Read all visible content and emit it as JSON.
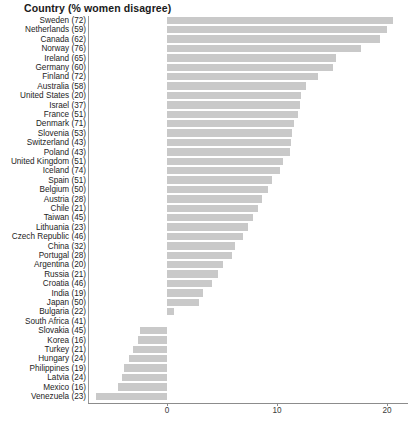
{
  "chart_data": {
    "type": "bar",
    "orientation": "horizontal",
    "title": "Country (% women disagree)",
    "xlabel": "",
    "ylabel": "",
    "xlim": [
      -7.0,
      21.5
    ],
    "grid": false,
    "legend": null,
    "axis_ticks": [
      {
        "label": "0",
        "value": 0
      },
      {
        "label": "10",
        "value": 10
      },
      {
        "label": "20",
        "value": 20
      }
    ],
    "bar_color": "#c9c9c9",
    "categories": [
      "Sweden (72)",
      "Netherlands (59)",
      "Canada (62)",
      "Norway (76)",
      "Ireland (65)",
      "Germany (60)",
      "Finland (72)",
      "Australia (58)",
      "United States (20)",
      "Israel (37)",
      "France (51)",
      "Denmark (71)",
      "Slovenia (53)",
      "Switzerland (43)",
      "Poland (43)",
      "United Kingdom (51)",
      "Iceland (74)",
      "Spain (51)",
      "Belgium (50)",
      "Austria (28)",
      "Chile (21)",
      "Taiwan (45)",
      "Lithuania (23)",
      "Czech Republic (46)",
      "China (32)",
      "Portugal (28)",
      "Argentina (20)",
      "Russia (21)",
      "Croatia (46)",
      "India (19)",
      "Japan (50)",
      "Bulgaria (22)",
      "South Africa (41)",
      "Slovakia (45)",
      "Korea (16)",
      "Turkey (21)",
      "Hungary (24)",
      "Philippines (19)",
      "Latvia (24)",
      "Mexico (16)",
      "Venezuela (23)"
    ],
    "values": [
      20.5,
      20.0,
      19.4,
      17.6,
      15.4,
      15.1,
      13.7,
      12.6,
      12.2,
      12.1,
      11.9,
      11.5,
      11.4,
      11.3,
      11.2,
      10.5,
      10.3,
      9.5,
      9.2,
      8.6,
      8.3,
      7.8,
      7.4,
      6.9,
      6.2,
      5.9,
      5.1,
      4.6,
      4.1,
      3.3,
      2.9,
      0.6,
      0.0,
      -2.5,
      -2.6,
      -3.1,
      -3.5,
      -3.9,
      -4.1,
      -4.5,
      -6.5
    ]
  }
}
